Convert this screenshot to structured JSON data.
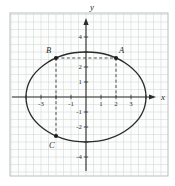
{
  "figure": {
    "colors": {
      "background": "#ffffff",
      "paper_bg": "#fdfdfb",
      "paper_border": "#a8aeb2",
      "grid": "#c9d2da",
      "axis": "#2b2b2b",
      "curve": "#2b2b2b",
      "dashed": "#3a3a3a",
      "point": "#1d1d1d",
      "label": "#2b2b2b"
    }
  },
  "chart_data": {
    "type": "line",
    "title": "",
    "curve": {
      "kind": "ellipse",
      "cx": 0,
      "cy": 0,
      "rx": 4,
      "ry": 3
    },
    "points": [
      {
        "label": "A",
        "x": 2,
        "y": 2.6,
        "label_dx": 3,
        "label_dy": -5
      },
      {
        "label": "B",
        "x": -2,
        "y": 2.6,
        "label_dx": -10,
        "label_dy": -5
      },
      {
        "label": "C",
        "x": -2,
        "y": -2.6,
        "label_dx": -7,
        "label_dy": 12
      }
    ],
    "dashed_segments": [
      {
        "from": [
          -2,
          2.6
        ],
        "to": [
          2,
          2.6
        ]
      },
      {
        "from": [
          2,
          2.6
        ],
        "to": [
          2,
          0
        ]
      },
      {
        "from": [
          -2,
          2.6
        ],
        "to": [
          -2,
          -2.6
        ]
      }
    ],
    "xlabel": "x",
    "ylabel": "y",
    "xlim": [
      -5,
      5.3
    ],
    "ylim": [
      -5.3,
      5.3
    ],
    "grid_step": 0.5,
    "ticks_at": [
      -4,
      -3,
      -2,
      -1,
      1,
      2,
      3,
      4
    ],
    "x_tick_labels": [
      -3,
      -1,
      1,
      2,
      3
    ],
    "y_tick_labels": [
      4,
      2,
      1,
      -1,
      -2,
      -4
    ],
    "legend": "none"
  }
}
